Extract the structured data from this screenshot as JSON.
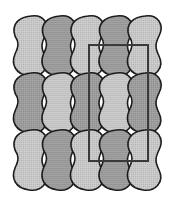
{
  "diagram": {
    "type": "tiling",
    "rows": 3,
    "columns": 5,
    "colors": {
      "background": "#ffffff",
      "tile_light": "#c9c9c9",
      "tile_dark": "#9d9d9d",
      "outline": "#1a1a1a",
      "unit_cell": "#3a3a3a"
    },
    "tiles": [
      {
        "row": 0,
        "col": 0,
        "shade": "light"
      },
      {
        "row": 0,
        "col": 1,
        "shade": "dark"
      },
      {
        "row": 0,
        "col": 2,
        "shade": "light"
      },
      {
        "row": 0,
        "col": 3,
        "shade": "dark"
      },
      {
        "row": 0,
        "col": 4,
        "shade": "light"
      },
      {
        "row": 1,
        "col": 0,
        "shade": "dark"
      },
      {
        "row": 1,
        "col": 1,
        "shade": "light"
      },
      {
        "row": 1,
        "col": 2,
        "shade": "dark"
      },
      {
        "row": 1,
        "col": 3,
        "shade": "light"
      },
      {
        "row": 1,
        "col": 4,
        "shade": "dark"
      },
      {
        "row": 2,
        "col": 0,
        "shade": "light"
      },
      {
        "row": 2,
        "col": 1,
        "shade": "dark"
      },
      {
        "row": 2,
        "col": 2,
        "shade": "light"
      },
      {
        "row": 2,
        "col": 3,
        "shade": "dark"
      },
      {
        "row": 2,
        "col": 4,
        "shade": "light"
      }
    ],
    "unit_cell": {
      "x": 89,
      "y": 45,
      "width": 59,
      "height": 116
    }
  }
}
